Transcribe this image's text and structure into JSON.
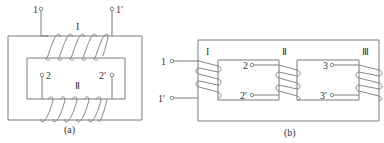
{
  "diagram_a": {
    "caption": "(a)",
    "winding_primary_label": "I",
    "winding_secondary_label": "Ⅱ",
    "terminals": {
      "t1": "1",
      "t1p": "1′",
      "t2": "2",
      "t2p": "2′"
    },
    "primary_turns": 5,
    "secondary_turns": 5
  },
  "diagram_b": {
    "caption": "(b)",
    "winding_labels": [
      "I",
      "Ⅱ",
      "Ⅲ"
    ],
    "terminals": {
      "t1": "1",
      "t1p": "1′",
      "t2": "2",
      "t2p": "2′",
      "t3": "3",
      "t3p": "3′"
    },
    "turns_per_winding": 3
  },
  "colors": {
    "line": "#7a7a7a",
    "text": "#333333",
    "background": "#ffffff"
  }
}
